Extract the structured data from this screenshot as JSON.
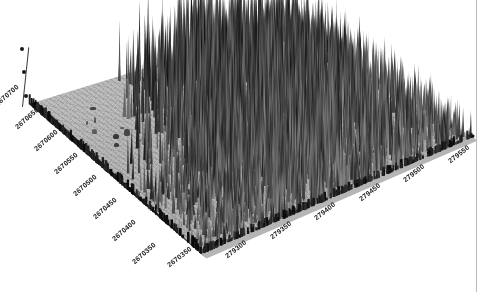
{
  "figure": {
    "type": "3d-point-cloud-surface",
    "title": "",
    "background_color": "#ffffff",
    "canopy_color": "#1e1e1e",
    "ground_color": "#b2b2b2",
    "edge_color": "#1b1b1b"
  },
  "axes": {
    "y_axis": {
      "name": "northing",
      "label": "",
      "units": "m (UTM northing)",
      "orientation": "left-receding",
      "ticks": [
        "2670700",
        "2670650",
        "2670600",
        "2670550",
        "2670500",
        "2670450",
        "2670400",
        "2670350"
      ],
      "range": [
        2670350,
        2670700
      ],
      "spacing": 50
    },
    "x_axis": {
      "name": "easting",
      "label": "",
      "units": "m (UTM easting)",
      "orientation": "bottom-right-receding",
      "ticks": [
        "279300",
        "279350",
        "279400",
        "279450",
        "279500",
        "279550"
      ],
      "range": [
        279300,
        279550
      ],
      "spacing": 50
    },
    "z_axis": {
      "name": "elevation",
      "label": "",
      "units": "m",
      "orientation": "vertical-left",
      "tick_count": 3,
      "visible_ticks": [
        "",
        "",
        ""
      ]
    }
  },
  "chart_data": {
    "type": "heatmap",
    "title": "",
    "xlabel": "easting (m)",
    "ylabel": "northing (m)",
    "zlabel": "elevation (m)",
    "x": [
      279300,
      279350,
      279400,
      279450,
      279500,
      279550
    ],
    "y": [
      2670350,
      2670400,
      2670450,
      2670500,
      2670550,
      2670600,
      2670650,
      2670700
    ],
    "legend": [],
    "grid": false
  }
}
